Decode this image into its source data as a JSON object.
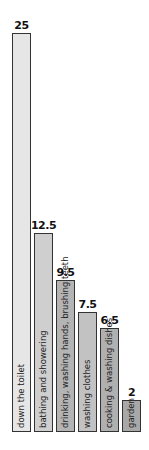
{
  "chart_data": {
    "type": "bar",
    "orientation": "vertical",
    "title": "",
    "xlabel": "",
    "ylabel": "",
    "grid": false,
    "legend": null,
    "categories": [
      "down the toilet",
      "bathing and showering",
      "drinking, washing hands, brushing teeth",
      "washing clothes",
      "cooking & washing dishes",
      "garden"
    ],
    "values": [
      25,
      12.5,
      9.5,
      7.5,
      6.5,
      2
    ],
    "value_labels": [
      "25",
      "12.5",
      "9.5",
      "7.5",
      "6.5",
      "2"
    ],
    "colors": [
      "#e6e6e6",
      "#cfcfcf",
      "#b4b4b4",
      "#c2c2c2",
      "#b0b0b0",
      "#a8a8a8"
    ],
    "ylim": [
      0,
      25
    ]
  }
}
